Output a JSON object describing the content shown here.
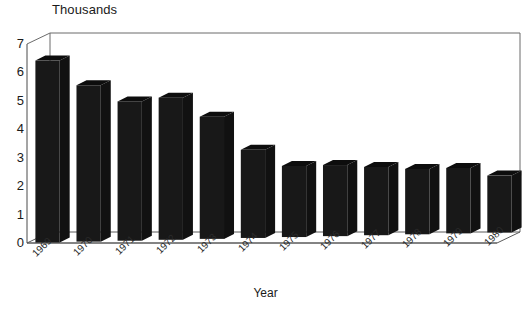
{
  "chart_data": {
    "type": "bar",
    "title": "Thousands",
    "xlabel": "Year",
    "ylabel": "",
    "categories": [
      "1969",
      "1970",
      "1971",
      "1972",
      "1973",
      "1974",
      "1975",
      "1976",
      "1977",
      "1978",
      "1979",
      "1980"
    ],
    "values": [
      6.4,
      5.5,
      4.9,
      5.0,
      4.3,
      3.1,
      2.5,
      2.5,
      2.4,
      2.3,
      2.3,
      2.0
    ],
    "ylim": [
      0,
      7
    ],
    "yticks": [
      0,
      1,
      2,
      3,
      4,
      5,
      6,
      7
    ],
    "ytick_labels": [
      "0",
      "1",
      "2",
      "3",
      "4",
      "5",
      "6",
      "7"
    ],
    "grid": false,
    "legend": null,
    "style": "3d-column",
    "bar_color": "#181818",
    "frame_color": "#6b6b6b",
    "text_color": "#1a1a1a"
  }
}
